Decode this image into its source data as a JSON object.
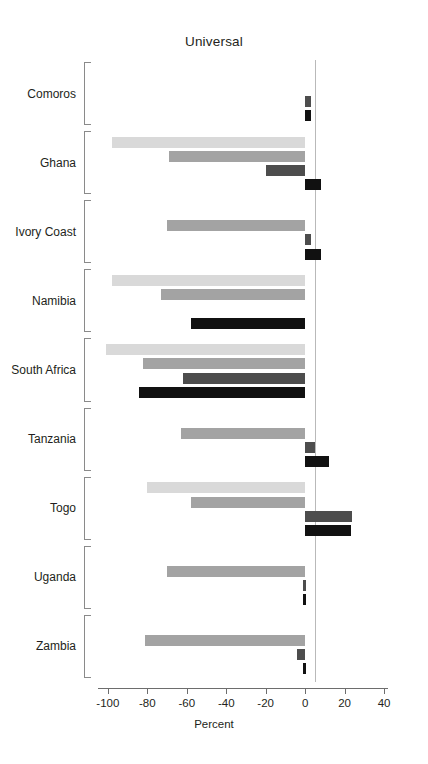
{
  "chart": {
    "title": "Universal",
    "axis_title": "Percent"
  },
  "chart_data": {
    "type": "bar",
    "orientation": "horizontal",
    "title": "Universal",
    "xlabel": "Percent",
    "ylabel": "",
    "xlim": [
      -105,
      42
    ],
    "xticks": [
      -100,
      -80,
      -60,
      -40,
      -20,
      0,
      20,
      40
    ],
    "xtick_labels": [
      "-100",
      "-80",
      "-60",
      "-40",
      "-20",
      "0",
      "20",
      "40"
    ],
    "grid": false,
    "legend": "none",
    "zero_reference_line": true,
    "categories": [
      "Comoros",
      "Ghana",
      "Ivory Coast",
      "Namibia",
      "South Africa",
      "Tanzania",
      "Togo",
      "Uganda",
      "Zambia"
    ],
    "series": [
      {
        "name": "series-1",
        "color": "#d9d9d9",
        "values": [
          0,
          -98,
          0,
          -98,
          -101,
          0,
          -80,
          0,
          0
        ]
      },
      {
        "name": "series-2",
        "color": "#a3a3a3",
        "values": [
          0,
          -69,
          -70,
          -73,
          -82,
          -63,
          -58,
          -70,
          -81
        ]
      },
      {
        "name": "series-3",
        "color": "#4d4d4d",
        "values": [
          3,
          -20,
          3,
          0,
          -62,
          5,
          24,
          -1,
          -4
        ]
      },
      {
        "name": "series-4",
        "color": "#111111",
        "values": [
          3,
          8,
          8,
          -58,
          -84,
          12,
          23,
          -1,
          -1
        ]
      }
    ]
  }
}
